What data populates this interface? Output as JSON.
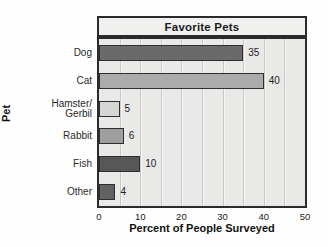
{
  "chart_data": {
    "type": "bar",
    "orientation": "horizontal",
    "title": "Favorite Pets",
    "categories": [
      "Dog",
      "Cat",
      "Hamster/Gerbil",
      "Rabbit",
      "Fish",
      "Other"
    ],
    "values": [
      35,
      40,
      5,
      6,
      10,
      4
    ],
    "row_labels": [
      "Dog",
      "Cat",
      "Hamster/\nGerbil",
      "Rabbit",
      "Fish",
      "Other"
    ],
    "xlabel": "Percent of People Surveyed",
    "ylabel": "Pet",
    "xlim": [
      0,
      50
    ],
    "x_ticks": [
      0,
      10,
      20,
      30,
      40,
      50
    ],
    "gridline_step": 5,
    "grid": "on",
    "bar_colors": [
      "#6a6a6a",
      "#ababab",
      "#d6d6d5",
      "#9e9e9e",
      "#575757",
      "#626262"
    ],
    "colors": {
      "plot_background": "#e9e9e8",
      "title_background": "#f0f0ef",
      "border": "#2b2b2b",
      "gridline": "#c7c7c6"
    }
  }
}
